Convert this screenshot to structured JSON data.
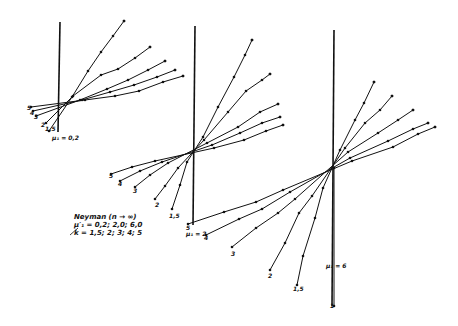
{
  "legend": {
    "title": "Neyman (n → ∞)",
    "mu_line": "μ′₁ = 0,2; 2,0; 6,0",
    "k_line": "k = 1,5; 2; 3; 4; 5"
  },
  "groups": [
    {
      "name": "mu-0.2",
      "label": "μ₁ = 0,2",
      "axis": {
        "x": 60,
        "top": 22,
        "bottom": 132
      },
      "center": [
        79,
        101
      ],
      "label_pos": [
        52,
        140
      ],
      "fan_labels": [
        {
          "text": "5",
          "x": 27,
          "y": 110
        },
        {
          "text": "4",
          "x": 30,
          "y": 115
        },
        {
          "text": "3",
          "x": 34,
          "y": 119
        },
        {
          "text": "2",
          "x": 41,
          "y": 127
        },
        {
          "text": "1,5",
          "x": 45,
          "y": 131
        }
      ],
      "lines": [
        {
          "k": "1,5",
          "from": [
            49,
            131
          ],
          "to": [
            124,
            21
          ],
          "points": [
            [
              72,
              97
            ],
            [
              88,
              71
            ],
            [
              101,
              52
            ],
            [
              113,
              36
            ],
            [
              124,
              21
            ]
          ]
        },
        {
          "k": "2",
          "from": [
            46,
            123
          ],
          "to": [
            150,
            47
          ],
          "points": [
            [
              73,
              96
            ],
            [
              101,
              75
            ],
            [
              118,
              69
            ],
            [
              135,
              58
            ],
            [
              150,
              47
            ]
          ]
        },
        {
          "k": "3",
          "from": [
            36,
            116
          ],
          "to": [
            165,
            61
          ],
          "points": [
            [
              80,
              100
            ],
            [
              107,
              89
            ],
            [
              128,
              80
            ],
            [
              148,
              70
            ],
            [
              165,
              61
            ]
          ]
        },
        {
          "k": "4",
          "from": [
            33,
            111
          ],
          "to": [
            175,
            70
          ],
          "points": [
            [
              82,
              100
            ],
            [
              110,
              92
            ],
            [
              134,
              85
            ],
            [
              157,
              77
            ],
            [
              175,
              70
            ]
          ]
        },
        {
          "k": "5",
          "from": [
            31,
            107
          ],
          "to": [
            183,
            76
          ],
          "points": [
            [
              85,
              100
            ],
            [
              115,
              96
            ],
            [
              139,
              91
            ],
            [
              163,
              82
            ],
            [
              183,
              76
            ]
          ]
        }
      ]
    },
    {
      "name": "mu-2",
      "label": "μ₁ = 2",
      "axis": {
        "x": 195,
        "top": 26,
        "bottom": 225
      },
      "center": [
        192,
        153
      ],
      "label_pos": [
        186,
        236
      ],
      "fan_labels": [
        {
          "text": "5",
          "x": 109,
          "y": 178
        },
        {
          "text": "4",
          "x": 118,
          "y": 186
        },
        {
          "text": "3",
          "x": 133,
          "y": 193
        },
        {
          "text": "2",
          "x": 155,
          "y": 207
        },
        {
          "text": "1,5",
          "x": 169,
          "y": 218
        }
      ],
      "lines": [
        {
          "k": "1,5",
          "from": [
            172,
            209
          ],
          "to": [
            252,
            40
          ],
          "points": [
            [
              180,
              185
            ],
            [
              187,
              162
            ],
            [
              203,
              137
            ],
            [
              218,
              107
            ],
            [
              234,
              77
            ],
            [
              245,
              55
            ],
            [
              252,
              40
            ]
          ]
        },
        {
          "k": "2",
          "from": [
            155,
            199
          ],
          "to": [
            270,
            74
          ],
          "points": [
            [
              165,
              186
            ],
            [
              178,
              168
            ],
            [
              204,
              140
            ],
            [
              228,
              112
            ],
            [
              246,
              91
            ],
            [
              262,
              80
            ],
            [
              270,
              74
            ]
          ]
        },
        {
          "k": "3",
          "from": [
            135,
            187
          ],
          "to": [
            278,
            104
          ],
          "points": [
            [
              150,
              175
            ],
            [
              168,
              163
            ],
            [
              207,
              143
            ],
            [
              238,
              127
            ],
            [
              260,
              112
            ],
            [
              278,
              104
            ]
          ]
        },
        {
          "k": "4",
          "from": [
            120,
            181
          ],
          "to": [
            280,
            117
          ],
          "points": [
            [
              140,
              171
            ],
            [
              162,
              162
            ],
            [
              212,
              145
            ],
            [
              240,
              133
            ],
            [
              262,
              123
            ],
            [
              280,
              117
            ]
          ]
        },
        {
          "k": "5",
          "from": [
            111,
            174
          ],
          "to": [
            283,
            125
          ],
          "points": [
            [
              132,
              167
            ],
            [
              155,
              161
            ],
            [
              214,
              148
            ],
            [
              244,
              140
            ],
            [
              266,
              131
            ],
            [
              283,
              125
            ]
          ]
        }
      ]
    },
    {
      "name": "mu-6",
      "label": "μ₁ = 6",
      "axis": {
        "x": 334,
        "top": 30,
        "bottom": 306
      },
      "center": [
        334,
        168
      ],
      "label_pos": [
        326,
        268
      ],
      "fan_labels": [
        {
          "text": "5",
          "x": 186,
          "y": 230
        },
        {
          "text": "4",
          "x": 204,
          "y": 240
        },
        {
          "text": "3",
          "x": 231,
          "y": 256
        },
        {
          "text": "2",
          "x": 268,
          "y": 278
        },
        {
          "text": "1,5",
          "x": 293,
          "y": 291
        },
        {
          "text": "1",
          "x": 330,
          "y": 308
        }
      ],
      "lines": [
        {
          "k": "1,5",
          "from": [
            297,
            285
          ],
          "to": [
            374,
            82
          ],
          "points": [
            [
              303,
              256
            ],
            [
              315,
              218
            ],
            [
              323,
              188
            ],
            [
              340,
              150
            ],
            [
              355,
              120
            ],
            [
              364,
              103
            ],
            [
              374,
              82
            ]
          ]
        },
        {
          "k": "2",
          "from": [
            270,
            270
          ],
          "to": [
            392,
            96
          ],
          "points": [
            [
              285,
              243
            ],
            [
              299,
              213
            ],
            [
              312,
              196
            ],
            [
              345,
              148
            ],
            [
              365,
              123
            ],
            [
              380,
              110
            ],
            [
              392,
              96
            ]
          ]
        },
        {
          "k": "3",
          "from": [
            232,
            247
          ],
          "to": [
            413,
            110
          ],
          "points": [
            [
              256,
              228
            ],
            [
              278,
              213
            ],
            [
              295,
              199
            ],
            [
              348,
              152
            ],
            [
              378,
              133
            ],
            [
              398,
              120
            ],
            [
              413,
              110
            ]
          ]
        },
        {
          "k": "4",
          "from": [
            206,
            235
          ],
          "to": [
            428,
            123
          ],
          "points": [
            [
              239,
              219
            ],
            [
              262,
              209
            ],
            [
              290,
              192
            ],
            [
              350,
              158
            ],
            [
              388,
              141
            ],
            [
              413,
              129
            ],
            [
              428,
              123
            ]
          ]
        },
        {
          "k": "5",
          "from": [
            188,
            224
          ],
          "to": [
            435,
            127
          ],
          "points": [
            [
              224,
              212
            ],
            [
              256,
              202
            ],
            [
              283,
              190
            ],
            [
              352,
              161
            ],
            [
              393,
              147
            ],
            [
              418,
              134
            ],
            [
              435,
              127
            ]
          ]
        },
        {
          "k": "1",
          "from": [
            334,
            168
          ],
          "to": [
            334,
            306
          ],
          "points": []
        }
      ]
    }
  ]
}
